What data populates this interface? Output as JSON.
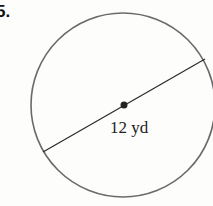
{
  "problem": {
    "number": "5."
  },
  "diagram": {
    "shape": "circle",
    "diameter_label": "12 yd",
    "colors": {
      "stroke": "#6a6a6a",
      "line": "#2a2a2a",
      "text": "#222222"
    }
  }
}
